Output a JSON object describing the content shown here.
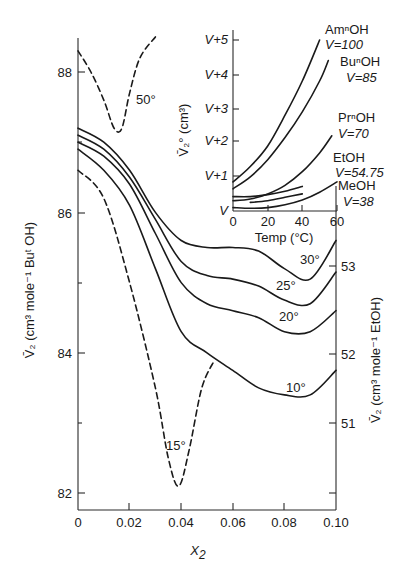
{
  "chart_data": [
    {
      "type": "line",
      "title": "",
      "xlabel": "X2",
      "ylabel_left": "V̄2 (cm3 mole-1 ButOH)",
      "ylabel_right": "V̄2 (cm3 mole-1 EtOH)",
      "xlim": [
        0,
        0.1
      ],
      "ylim_left": [
        81.7,
        88.6
      ],
      "x_ticks": [
        "0",
        "0.02",
        "0.04",
        "0.06",
        "0.08",
        "0.10"
      ],
      "x_tick_values": [
        0,
        0.02,
        0.04,
        0.06,
        0.08,
        0.1
      ],
      "y_ticks_left": [
        "82",
        "84",
        "86",
        "88"
      ],
      "y_tick_values_left": [
        82,
        84,
        86,
        88
      ],
      "y_ticks_right": [
        "51",
        "52",
        "53"
      ],
      "y_tick_values_right_on_left_scale": [
        83.29,
        84.96,
        86.64
      ],
      "grid": false,
      "legend": "inline labels",
      "series": [
        {
          "name": "50°",
          "solvent": "ButOH",
          "style": "dashed",
          "x": [
            0.0,
            0.005,
            0.01,
            0.014,
            0.017,
            0.02,
            0.024,
            0.03
          ],
          "y": [
            88.3,
            88.0,
            87.6,
            87.2,
            87.2,
            87.7,
            88.2,
            88.5
          ]
        },
        {
          "name": "30°",
          "solvent": "EtOH",
          "style": "solid",
          "x": [
            0.0,
            0.01,
            0.02,
            0.03,
            0.04,
            0.05,
            0.06,
            0.07,
            0.08,
            0.09,
            0.1
          ],
          "y": [
            87.2,
            87.0,
            86.6,
            86.0,
            85.6,
            85.5,
            85.5,
            85.45,
            85.2,
            85.05,
            85.6
          ]
        },
        {
          "name": "25°",
          "solvent": "EtOH",
          "style": "solid",
          "x": [
            0.0,
            0.01,
            0.02,
            0.03,
            0.04,
            0.05,
            0.06,
            0.07,
            0.08,
            0.09,
            0.1
          ],
          "y": [
            87.1,
            86.9,
            86.5,
            85.9,
            85.3,
            85.1,
            85.05,
            84.95,
            84.75,
            84.7,
            85.15
          ]
        },
        {
          "name": "20°",
          "solvent": "EtOH",
          "style": "solid",
          "x": [
            0.0,
            0.01,
            0.02,
            0.03,
            0.04,
            0.05,
            0.06,
            0.07,
            0.08,
            0.09,
            0.1
          ],
          "y": [
            87.0,
            86.8,
            86.4,
            85.7,
            85.0,
            84.7,
            84.6,
            84.5,
            84.3,
            84.3,
            84.6
          ]
        },
        {
          "name": "10°",
          "solvent": "EtOH",
          "style": "solid",
          "x": [
            0.0,
            0.01,
            0.02,
            0.03,
            0.04,
            0.05,
            0.06,
            0.07,
            0.08,
            0.09,
            0.1
          ],
          "y": [
            86.9,
            86.6,
            86.1,
            85.2,
            84.3,
            84.0,
            83.75,
            83.5,
            83.4,
            83.4,
            83.75
          ]
        },
        {
          "name": "15°",
          "solvent": "ButOH",
          "style": "dashed",
          "x": [
            0.0,
            0.01,
            0.02,
            0.03,
            0.035,
            0.039,
            0.043,
            0.048,
            0.053
          ],
          "y": [
            86.6,
            86.2,
            85.0,
            83.5,
            82.5,
            82.1,
            82.6,
            83.5,
            83.9
          ]
        }
      ]
    },
    {
      "type": "line",
      "title": "inset",
      "xlabel": "Temp (°C)",
      "ylabel": "V̄2° (cm3)",
      "xlim": [
        0,
        60
      ],
      "x_ticks": [
        "0",
        "20",
        "40",
        "60"
      ],
      "y_ticks": [
        "V",
        "V+1",
        "V+2",
        "V+3",
        "V+4",
        "V+5"
      ],
      "ylim": [
        0,
        5
      ],
      "grid": false,
      "series": [
        {
          "name": "AmⁿOH",
          "V": 100,
          "x": [
            0,
            10,
            20,
            30,
            40,
            50
          ],
          "y": [
            0.85,
            1.3,
            1.9,
            2.8,
            3.8,
            5.0
          ]
        },
        {
          "name": "BuⁿOH",
          "V": 85,
          "x": [
            0,
            10,
            20,
            30,
            40,
            50,
            55
          ],
          "y": [
            0.65,
            1.0,
            1.5,
            2.15,
            2.9,
            3.8,
            4.4
          ]
        },
        {
          "name": "PrⁿOH",
          "V": 70,
          "x": [
            0,
            10,
            20,
            30,
            40,
            50,
            57
          ],
          "y": [
            0.3,
            0.35,
            0.5,
            0.75,
            1.15,
            1.7,
            2.2
          ]
        },
        {
          "name": "EtOH",
          "V": 54.75,
          "x": [
            0,
            10,
            20,
            30,
            40
          ],
          "y": [
            0.42,
            0.42,
            0.48,
            0.58,
            0.72
          ]
        },
        {
          "name": "MeOH",
          "V": 38,
          "x": [
            0,
            10,
            20,
            30,
            40,
            50,
            60
          ],
          "y": [
            0.1,
            0.08,
            0.1,
            0.18,
            0.32,
            0.55,
            0.85
          ]
        },
        {
          "name": "extra",
          "x": [
            10,
            20,
            30,
            40
          ],
          "y": [
            0.25,
            0.3,
            0.4,
            0.5
          ]
        }
      ]
    }
  ],
  "labels": {
    "x_axis": "X",
    "x_axis_sub": "2",
    "left_axis": "V̄₂ (cm³ mole⁻¹ Buᵗ OH)",
    "right_axis": "V̄₂ (cm³ mole⁻¹ EtOH)",
    "inset_y_axis": "V̄₂° (cm³)",
    "inset_x_axis": "Temp (°C)",
    "curve_50": "50°",
    "curve_30": "30°",
    "curve_25": "25°",
    "curve_20": "20°",
    "curve_10": "10°",
    "curve_15": "15°",
    "inset_am": "AmⁿOH",
    "inset_am_v": "V=100",
    "inset_bu": "BuⁿOH",
    "inset_bu_v": "V=85",
    "inset_pr": "PrⁿOH",
    "inset_pr_v": "V=70",
    "inset_et": "EtOH",
    "inset_et_v": "V=54.75",
    "inset_me": "MeOH",
    "inset_me_v": "V=38"
  }
}
